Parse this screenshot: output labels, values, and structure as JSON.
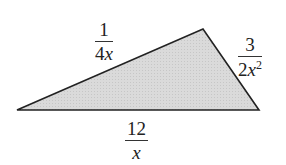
{
  "figure": {
    "type": "triangle",
    "fill_color": "#d8d8d8",
    "stroke_color": "#222222",
    "vertices": {
      "left": [
        17,
        110
      ],
      "top": [
        203,
        29
      ],
      "right": [
        259,
        110
      ]
    }
  },
  "labels": {
    "left_side": {
      "numerator": "1",
      "denominator_coef": "4",
      "denominator_var": "x",
      "denominator_exp": ""
    },
    "right_side": {
      "numerator": "3",
      "denominator_coef": "2",
      "denominator_var": "x",
      "denominator_exp": "2"
    },
    "bottom_side": {
      "numerator": "12",
      "denominator_coef": "",
      "denominator_var": "x",
      "denominator_exp": ""
    }
  }
}
